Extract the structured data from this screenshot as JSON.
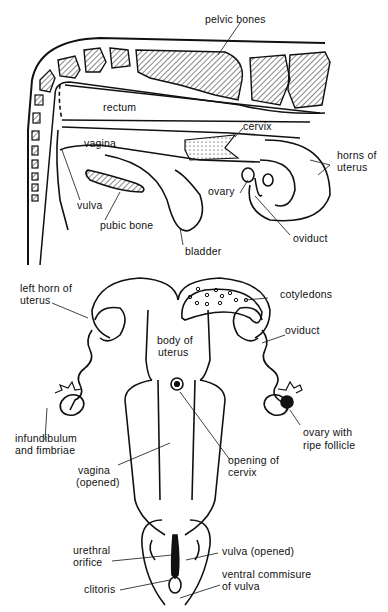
{
  "figure": {
    "top_panel": {
      "name": "lateral view of reproductive tract",
      "labels": {
        "pelvic_bones": "pelvic bones",
        "rectum": "rectum",
        "cervix": "cervix",
        "vagina": "vagina",
        "horns_of_uterus_1": "horns of",
        "horns_of_uterus_2": "uterus",
        "ovary": "ovary",
        "vulva": "vulva",
        "pubic_bone": "pubic bone",
        "oviduct": "oviduct",
        "bladder": "bladder"
      }
    },
    "bottom_panel": {
      "name": "dorsal view of opened reproductive tract",
      "labels": {
        "left_horn_1": "left horn of",
        "left_horn_2": "uterus",
        "cotyledons": "cotyledons",
        "oviduct": "oviduct",
        "body_of_uterus_1": "body of",
        "body_of_uterus_2": "uterus",
        "infundibulum_1": "infundibulum",
        "infundibulum_2": "and fimbriae",
        "ovary_follicle_1": "ovary with",
        "ovary_follicle_2": "ripe follicle",
        "opening_cervix_1": "opening of",
        "opening_cervix_2": "cervix",
        "vagina_1": "vagina",
        "vagina_2": "(opened)",
        "urethral_1": "urethral",
        "urethral_2": "orifice",
        "vulva_opened": "vulva (opened)",
        "clitoris": "clitoris",
        "ventral_1": "ventral commisure",
        "ventral_2": "of vulva"
      }
    }
  }
}
